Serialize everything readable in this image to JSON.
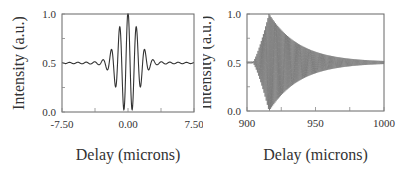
{
  "chart_data": [
    {
      "type": "line",
      "title": "",
      "xlabel": "Delay (microns)",
      "ylabel": "Intensity (a.u.)",
      "xlim": [
        -7.5,
        7.5
      ],
      "ylim": [
        0.0,
        1.0
      ],
      "xticks": [
        "-7.50",
        "0.00",
        "7.50"
      ],
      "yticks": [
        "0.0",
        "0.5",
        "1.0"
      ],
      "grid": false,
      "legend": null,
      "description": "White-light interferogram: damped cosine fringes centered near 0, baseline 0.5, peak 1.0 at center, minimum ~0.0",
      "series": [
        {
          "name": "interferogram",
          "model": {
            "baseline": 0.5,
            "amplitude": 0.5,
            "center": 0.0,
            "fringe_period": 0.95,
            "envelope_width": 1.6,
            "tail": 0.02
          }
        }
      ],
      "color": "#333333"
    },
    {
      "type": "line",
      "title": "",
      "xlabel": "Delay (microns)",
      "ylabel": "Intensity (a.u.)",
      "xlim": [
        900,
        1000
      ],
      "ylim": [
        0.0,
        1.0
      ],
      "xticks": [
        "900",
        "950",
        "1000"
      ],
      "yticks": [
        "0.0",
        "0.5",
        "1.0"
      ],
      "grid": false,
      "legend": null,
      "description": "Dense fringes with rapid rise starting ~905, peak envelope ~1.0/0.0 near 915, decaying toward 0.5 by 1000",
      "series": [
        {
          "name": "interferogram",
          "model": {
            "baseline": 0.5,
            "onset": 904,
            "peak": 916,
            "peak_amplitude": 0.5,
            "decay": 22,
            "fringe_period": 0.8
          }
        }
      ],
      "color": "#444444"
    }
  ]
}
